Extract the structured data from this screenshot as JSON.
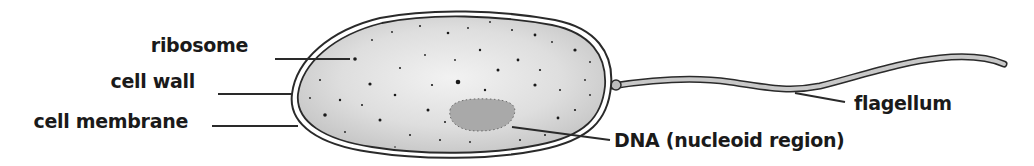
{
  "diagram": {
    "type": "labeled-illustration",
    "labels": {
      "ribosome": "ribosome",
      "cell_wall": "cell wall",
      "cell_membrane": "cell membrane",
      "dna": "DNA (nucleoid region)",
      "flagellum": "flagellum"
    },
    "colors": {
      "outline": "#2a2a2a",
      "cytoplasm": "#d4d4d4",
      "nucleoid": "#a9a9a9",
      "flagellum_fill": "#c8c8c8",
      "text": "#1a1a1a"
    }
  }
}
